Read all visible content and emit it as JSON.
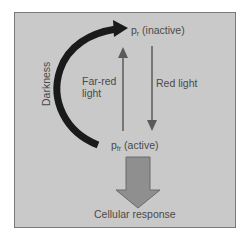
{
  "diagram": {
    "nodes": {
      "pr": {
        "symbol": "p",
        "subscript": "r",
        "state": "(inactive)"
      },
      "pfr": {
        "symbol": "p",
        "subscript": "fr",
        "state": "(active)"
      }
    },
    "edges": {
      "far_red": {
        "label_line1": "Far-red",
        "label_line2": "light",
        "from": "pfr",
        "to": "pr"
      },
      "red": {
        "label": "Red light",
        "from": "pr",
        "to": "pfr"
      },
      "darkness": {
        "label": "Darkness",
        "from": "pfr",
        "to": "pr"
      }
    },
    "output": {
      "label": "Cellular response"
    },
    "colors": {
      "background": "#c9c9c9",
      "frame_border": "#7a7a7a",
      "thin_arrow": "#5a5a5a",
      "darkness_arrow": "#1a1a1a",
      "block_arrow_fill": "#8f8f8f",
      "block_arrow_stroke": "#6a6a6a",
      "text": "#4a4a4a"
    }
  }
}
